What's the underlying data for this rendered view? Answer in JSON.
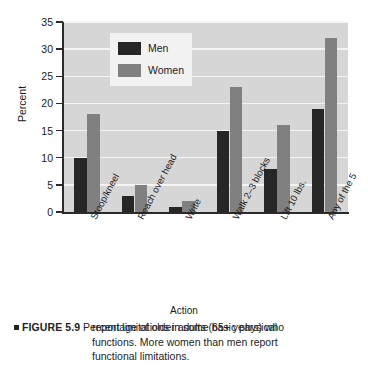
{
  "figure": {
    "label_bullet": "■",
    "label": "FIGURE 5.9",
    "caption_line1": "Percentage of older adults (65+ years) who",
    "caption_line2": "report limitations in some basic physical",
    "caption_line3": "functions. More women than men report",
    "caption_line4": "functional limitations."
  },
  "legend": {
    "position": "inside-top-left",
    "entries": [
      {
        "name": "Men",
        "color": "#262626"
      },
      {
        "name": "Women",
        "color": "#808080"
      }
    ]
  },
  "chart_data": {
    "type": "bar",
    "title": "",
    "xlabel": "Action",
    "ylabel": "Percent",
    "ylim": [
      0,
      35
    ],
    "yticks": [
      0,
      5,
      10,
      15,
      20,
      25,
      30,
      35
    ],
    "grid": true,
    "categories": [
      "Stoop/kneel",
      "Reach over head",
      "Write",
      "Walk 2–3 blocks",
      "Lift 10 lbs.",
      "Any of the 5"
    ],
    "series": [
      {
        "name": "Men",
        "color": "#262626",
        "values": [
          10,
          3,
          1,
          15,
          8,
          19
        ]
      },
      {
        "name": "Women",
        "color": "#808080",
        "values": [
          18,
          5,
          2,
          23,
          16,
          32
        ]
      }
    ]
  },
  "colors": {
    "plot_background": "#d6d6d6",
    "gridline": "#f4f4f4",
    "axis": "#2b2b2b",
    "page_background": "#ffffff"
  }
}
